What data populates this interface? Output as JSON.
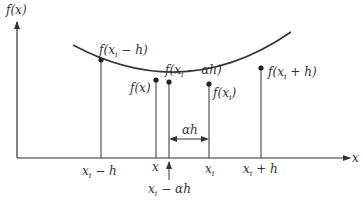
{
  "diagram": {
    "type": "function-interpolation-sketch",
    "colors": {
      "line": "#333333",
      "background": "#ffffff"
    },
    "axes": {
      "y_label": "f(x)",
      "x_label": "x"
    },
    "point_labels": {
      "f_xi_minus_h": "f(xi − h)",
      "f_x": "f(x)",
      "f_xi_minus_alpha_h": "f(xi − αh)",
      "f_xi": "f(xi)",
      "f_xi_plus_h": "f(xi + h)"
    },
    "tick_labels": {
      "xi_minus_h": "xi − h",
      "x": "x",
      "xi": "xi",
      "xi_plus_h": "xi + h",
      "xi_minus_alpha_h": "xi − αh"
    },
    "interval_label": "αh",
    "parts": {
      "f": "f(",
      "x": "x",
      "i": "i",
      "minus_h": " − h)",
      "plus_h": " + h)",
      "minus_ah": " − αh)",
      "close": ")",
      "minus_h_tick": " − h",
      "plus_h_tick": " + h",
      "minus_ah_tick": " − αh"
    }
  }
}
